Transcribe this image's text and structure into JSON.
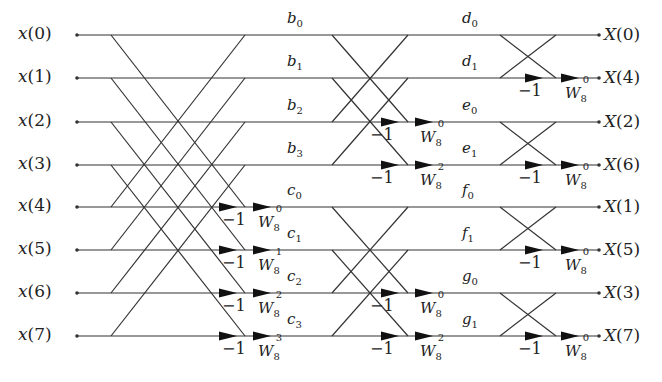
{
  "diagram": {
    "line_color": "#333333",
    "rows_y": [
      35,
      78,
      122,
      165,
      207,
      250,
      293,
      336
    ],
    "inputs": [
      "x(0)",
      "x(1)",
      "x(2)",
      "x(3)",
      "x(4)",
      "x(5)",
      "x(6)",
      "x(7)"
    ],
    "outputs": [
      "X(0)",
      "X(4)",
      "X(2)",
      "X(6)",
      "X(1)",
      "X(5)",
      "X(3)",
      "X(7)"
    ],
    "stage1": {
      "x_start": 111,
      "x_end": 245,
      "span": 4,
      "nodes": [
        {
          "letter": "b",
          "sub": "0"
        },
        {
          "letter": "b",
          "sub": "1"
        },
        {
          "letter": "b",
          "sub": "2"
        },
        {
          "letter": "b",
          "sub": "3"
        },
        {
          "letter": "c",
          "sub": "0"
        },
        {
          "letter": "c",
          "sub": "1"
        },
        {
          "letter": "c",
          "sub": "2"
        },
        {
          "letter": "c",
          "sub": "3"
        }
      ],
      "minus_one_rows": [
        4,
        5,
        6,
        7
      ],
      "twiddles": [
        {
          "row": 4,
          "base": "W",
          "sub": "8",
          "exp": "0"
        },
        {
          "row": 5,
          "base": "W",
          "sub": "8",
          "exp": "1"
        },
        {
          "row": 6,
          "base": "W",
          "sub": "8",
          "exp": "2"
        },
        {
          "row": 7,
          "base": "W",
          "sub": "8",
          "exp": "3"
        }
      ]
    },
    "stage2": {
      "x_start": 332,
      "x_end": 408,
      "span": 2,
      "nodes": [
        {
          "letter": "d",
          "sub": "0"
        },
        {
          "letter": "d",
          "sub": "1"
        },
        {
          "letter": "e",
          "sub": "0"
        },
        {
          "letter": "e",
          "sub": "1"
        },
        {
          "letter": "f",
          "sub": "0"
        },
        {
          "letter": "f",
          "sub": "1"
        },
        {
          "letter": "g",
          "sub": "0"
        },
        {
          "letter": "g",
          "sub": "1"
        }
      ],
      "minus_one_rows": [
        2,
        3,
        6,
        7
      ],
      "twiddles": [
        {
          "row": 2,
          "base": "W",
          "sub": "8",
          "exp": "0"
        },
        {
          "row": 3,
          "base": "W",
          "sub": "8",
          "exp": "2"
        },
        {
          "row": 6,
          "base": "W",
          "sub": "8",
          "exp": "0"
        },
        {
          "row": 7,
          "base": "W",
          "sub": "8",
          "exp": "2"
        }
      ]
    },
    "stage3": {
      "x_start": 500,
      "x_end": 556,
      "span": 1,
      "minus_one_rows": [
        1,
        3,
        5,
        7
      ],
      "twiddles": [
        {
          "row": 1,
          "base": "W",
          "sub": "8",
          "exp": "0"
        },
        {
          "row": 3,
          "base": "W",
          "sub": "8",
          "exp": "0"
        },
        {
          "row": 5,
          "base": "W",
          "sub": "8",
          "exp": "0"
        },
        {
          "row": 7,
          "base": "W",
          "sub": "8",
          "exp": "0"
        }
      ]
    },
    "minus_one_label": "−1",
    "x_input_dot": 77,
    "x_output_dot": 599
  }
}
